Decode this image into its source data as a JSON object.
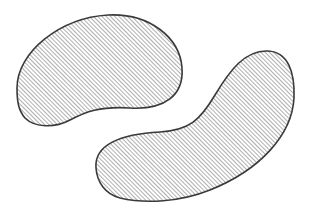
{
  "diagram": {
    "shapes": [
      {
        "id": "blob-upper-left",
        "label": "",
        "fill_pattern": "diagonal-hatch"
      },
      {
        "id": "blob-lower-right",
        "label": "",
        "fill_pattern": "diagonal-hatch"
      }
    ],
    "colors": {
      "background": "#ffffff",
      "outline": "#3a3a3a",
      "hatch": "#6b6b6b"
    }
  }
}
